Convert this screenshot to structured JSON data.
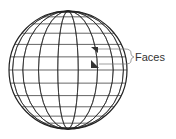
{
  "diagram": {
    "sphere": {
      "cx": 68,
      "cy": 70,
      "r": 59,
      "meridians": 18,
      "parallels": 14
    },
    "highlighted_faces": 2,
    "label": "Faces",
    "colors": {
      "line": "#222222",
      "face": "#333333",
      "label": "#333333"
    }
  }
}
